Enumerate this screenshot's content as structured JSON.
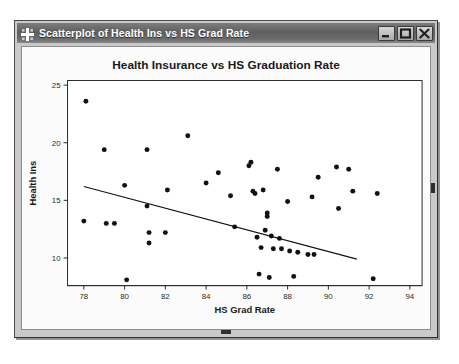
{
  "window": {
    "title": "Scatterplot of Health Ins vs HS Grad Rate",
    "icon": "crosshair-grid-icon",
    "buttons": {
      "minimize": "Minimize",
      "maximize": "Maximize",
      "close": "Close"
    }
  },
  "colors": {
    "titlebar_dark": "#5e5e5e",
    "titlebar_light": "#888888",
    "frame": "#c9c9c9",
    "panel": "#fbfbfb",
    "ink": "#111111"
  },
  "chart_data": {
    "type": "scatter",
    "title": "Health Insurance vs HS Graduation Rate",
    "xlabel": "HS Grad Rate",
    "ylabel": "Health Ins",
    "xlim": [
      77.2,
      94.6
    ],
    "ylim": [
      7.6,
      25.4
    ],
    "xticks": [
      78,
      80,
      82,
      84,
      86,
      88,
      90,
      92,
      94
    ],
    "yticks": [
      10,
      15,
      20,
      25
    ],
    "grid": false,
    "legend": false,
    "points": [
      [
        78.1,
        23.6
      ],
      [
        78.0,
        13.2
      ],
      [
        79.0,
        19.4
      ],
      [
        79.1,
        13.0
      ],
      [
        79.5,
        13.0
      ],
      [
        80.0,
        16.3
      ],
      [
        80.1,
        8.1
      ],
      [
        81.1,
        19.4
      ],
      [
        81.1,
        14.5
      ],
      [
        81.2,
        12.2
      ],
      [
        81.2,
        11.3
      ],
      [
        82.0,
        12.2
      ],
      [
        82.1,
        15.9
      ],
      [
        83.1,
        20.6
      ],
      [
        84.0,
        16.5
      ],
      [
        84.6,
        17.4
      ],
      [
        85.2,
        15.4
      ],
      [
        85.4,
        12.7
      ],
      [
        86.1,
        18.0
      ],
      [
        86.2,
        18.3
      ],
      [
        86.3,
        15.8
      ],
      [
        86.4,
        15.6
      ],
      [
        86.5,
        11.8
      ],
      [
        86.6,
        8.6
      ],
      [
        86.7,
        10.9
      ],
      [
        86.8,
        15.9
      ],
      [
        86.9,
        12.4
      ],
      [
        87.0,
        13.9
      ],
      [
        87.0,
        13.6
      ],
      [
        87.1,
        8.3
      ],
      [
        87.2,
        11.9
      ],
      [
        87.3,
        10.8
      ],
      [
        87.5,
        17.7
      ],
      [
        87.6,
        11.7
      ],
      [
        87.7,
        10.8
      ],
      [
        88.0,
        14.9
      ],
      [
        88.1,
        10.6
      ],
      [
        88.3,
        8.4
      ],
      [
        88.5,
        10.5
      ],
      [
        89.0,
        10.3
      ],
      [
        89.2,
        15.3
      ],
      [
        89.3,
        10.3
      ],
      [
        89.5,
        17.0
      ],
      [
        90.4,
        17.9
      ],
      [
        90.5,
        14.3
      ],
      [
        91.0,
        17.7
      ],
      [
        91.2,
        15.8
      ],
      [
        92.2,
        8.2
      ],
      [
        92.4,
        15.6
      ]
    ],
    "fit_line": {
      "name": "regression-line",
      "x0": 78.0,
      "y0": 16.2,
      "x1": 91.4,
      "y1": 9.9
    }
  }
}
